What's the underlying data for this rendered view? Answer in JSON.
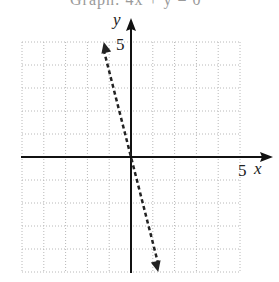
{
  "header": {
    "clipped_text": "Graph: 4x + y = 0"
  },
  "chart_data": {
    "type": "line",
    "title": "",
    "xlabel": "x",
    "ylabel": "y",
    "xlim": [
      -5,
      5
    ],
    "ylim": [
      -5,
      5
    ],
    "grid": true,
    "tick_labels": {
      "x": [
        "5"
      ],
      "y": [
        "5"
      ]
    },
    "series": [
      {
        "name": "y = -4x",
        "style": "dashed",
        "arrows": "both",
        "x": [
          -1.25,
          0,
          1.25
        ],
        "y": [
          5,
          0,
          -5
        ]
      }
    ]
  },
  "labels": {
    "x_axis": "x",
    "y_axis": "y",
    "x_tick": "5",
    "y_tick": "5"
  },
  "colors": {
    "axis": "#111111",
    "grid": "#b8b8b8",
    "line": "#222222"
  }
}
